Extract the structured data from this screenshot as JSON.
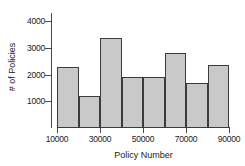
{
  "chart_data": {
    "type": "bar",
    "title": "",
    "subtitle": "",
    "xlabel": "Policy Number",
    "ylabel": "# of Policies",
    "bin_width": 10000,
    "bin_edges": [
      10000,
      20000,
      30000,
      40000,
      50000,
      60000,
      70000,
      80000,
      90000
    ],
    "categories": [
      "10000-20000",
      "20000-30000",
      "30000-40000",
      "40000-50000",
      "50000-60000",
      "60000-70000",
      "70000-80000",
      "80000-90000"
    ],
    "values": [
      2280,
      1200,
      3380,
      1900,
      1930,
      2830,
      1670,
      2350
    ],
    "x_ticks": [
      10000,
      30000,
      50000,
      70000,
      90000
    ],
    "x_tick_labels": [
      "10000",
      "30000",
      "50000",
      "70000",
      "90000"
    ],
    "xlim": [
      10000,
      90000
    ],
    "y_ticks": [
      1000,
      2000,
      3000,
      4000
    ],
    "y_tick_labels": [
      "1000",
      "2000",
      "3000",
      "4000"
    ],
    "ylim": [
      0,
      4500
    ],
    "grid": false,
    "legend": false,
    "bar_fill_color": "#c9c9c9",
    "bar_edge_color": "#3b3b3b",
    "axis_color": "#4a4a4a",
    "text_color": "#1b1b1b",
    "background_color": "#ffffff"
  }
}
